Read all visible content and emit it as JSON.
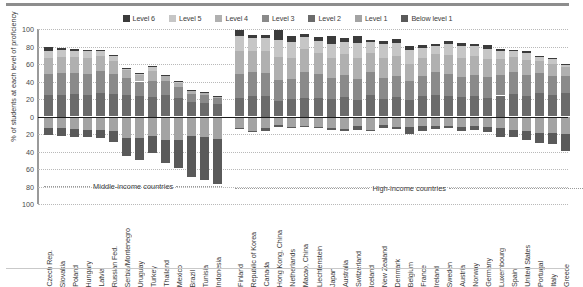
{
  "chart_data": {
    "type": "bar",
    "title": "",
    "subtitle": "",
    "xlabel": "",
    "ylabel": "% of students at each level of proficiency",
    "ylim": [
      -100,
      100
    ],
    "yticks": [
      100,
      80,
      60,
      40,
      20,
      0,
      20,
      40,
      60,
      80,
      100
    ],
    "grid": true,
    "legend_position": "top-center",
    "orientation": "diverging-stacked-vertical",
    "note": "Levels 2-6 plotted above the zero line; Level 1 and Below level 1 plotted below the zero line.",
    "legend": [
      {
        "name": "Level 6",
        "color": "#3b3b3b"
      },
      {
        "name": "Level 5",
        "color": "#c6c6c6"
      },
      {
        "name": "Level 4",
        "color": "#b0b0b0"
      },
      {
        "name": "Level 3",
        "color": "#8a8a8a"
      },
      {
        "name": "Level 2",
        "color": "#6b6b6b"
      },
      {
        "name": "Level 1",
        "color": "#a3a3a3"
      },
      {
        "name": "Below level 1",
        "color": "#5a5a5a"
      }
    ],
    "series": [
      {
        "name": "Level 6",
        "color": "#3b3b3b",
        "side": "up"
      },
      {
        "name": "Level 5",
        "color": "#c6c6c6",
        "side": "up"
      },
      {
        "name": "Level 4",
        "color": "#b0b0b0",
        "side": "up"
      },
      {
        "name": "Level 3",
        "color": "#8a8a8a",
        "side": "up"
      },
      {
        "name": "Level 2",
        "color": "#6b6b6b",
        "side": "up"
      },
      {
        "name": "Level 1",
        "color": "#a3a3a3",
        "side": "down"
      },
      {
        "name": "Below level 1",
        "color": "#5a5a5a",
        "side": "down"
      }
    ],
    "groups": [
      {
        "label": "Middle-income countries",
        "start": 0,
        "end": 13
      },
      {
        "label": "High-income countries",
        "start": 14,
        "end": 40
      }
    ],
    "categories": [
      "Czech Rep.",
      "Slovakia",
      "Poland",
      "Hungary",
      "Latvia",
      "Russian Fed.",
      "Serbia/Montenegro",
      "Uruguay",
      "Turkey",
      "Thailand",
      "Mexico",
      "Brazil",
      "Tunisia",
      "Indonesia",
      "Finland",
      "Republic of Korea",
      "Canada",
      "Hong Kong, China",
      "Netherlands",
      "Macao, China",
      "Liechtenstein",
      "Japan",
      "Australia",
      "Switzerland",
      "Iceland",
      "New Zealand",
      "Denmark",
      "Belgium",
      "France",
      "Ireland",
      "Sweden",
      "Austria",
      "Norway",
      "Germany",
      "Luxembourg",
      "Spain",
      "United States",
      "Portugal",
      "Italy",
      "Greece"
    ],
    "values": {
      "Level 6": [
        3.6,
        2.2,
        2.0,
        1.8,
        1.0,
        1.2,
        0.3,
        0.4,
        1.2,
        0.1,
        0.4,
        0.3,
        0.1,
        0.1,
        6.7,
        3.3,
        4.3,
        10.5,
        7.3,
        3.3,
        4.2,
        8.2,
        4.3,
        7.8,
        3.3,
        4.0,
        4.4,
        5.6,
        3.5,
        2.2,
        3.1,
        3.6,
        3.1,
        4.1,
        2.5,
        1.4,
        2.0,
        1.1,
        1.5,
        0.6
      ],
      "Level 5": [
        8.9,
        7.7,
        7.4,
        7.6,
        5.7,
        5.4,
        2.3,
        2.0,
        4.3,
        1.2,
        1.3,
        1.2,
        0.6,
        0.4,
        16.7,
        14.5,
        15.0,
        20.2,
        18.1,
        14.0,
        13.8,
        16.1,
        14.3,
        17.4,
        11.9,
        16.0,
        15.0,
        15.1,
        11.6,
        9.6,
        12.3,
        13.0,
        11.2,
        12.5,
        9.2,
        6.3,
        8.0,
        4.6,
        5.5,
        3.1
      ],
      "Level 4": [
        18.0,
        18.1,
        17.7,
        18.2,
        16.8,
        15.1,
        9.1,
        7.4,
        11.2,
        5.8,
        4.8,
        3.3,
        2.7,
        1.7,
        26.1,
        25.0,
        25.1,
        26.0,
        23.3,
        26.1,
        24.3,
        22.8,
        23.9,
        24.3,
        21.8,
        23.2,
        23.0,
        20.1,
        20.2,
        20.2,
        22.1,
        21.7,
        21.0,
        20.6,
        18.0,
        17.4,
        17.0,
        14.4,
        14.0,
        10.2
      ],
      "Level 3": [
        24.3,
        24.9,
        24.8,
        24.3,
        25.3,
        22.8,
        19.3,
        17.1,
        19.1,
        15.8,
        13.1,
        9.3,
        8.9,
        6.7,
        27.7,
        26.8,
        26.2,
        24.0,
        23.0,
        29.0,
        26.8,
        24.4,
        25.2,
        23.9,
        26.8,
        24.0,
        24.3,
        21.2,
        23.9,
        26.0,
        25.4,
        23.5,
        24.1,
        23.2,
        23.4,
        25.8,
        23.6,
        23.1,
        22.0,
        19.6
      ],
      "Level 2": [
        24.1,
        25.0,
        25.2,
        24.2,
        26.7,
        25.8,
        24.3,
        22.9,
        22.0,
        24.3,
        20.8,
        16.3,
        15.4,
        14.4,
        21.3,
        23.6,
        23.0,
        17.6,
        20.2,
        21.5,
        21.7,
        20.0,
        21.8,
        18.6,
        24.2,
        19.6,
        22.1,
        19.1,
        22.9,
        24.7,
        23.3,
        22.2,
        23.8,
        21.4,
        24.0,
        25.2,
        23.9,
        26.4,
        24.4,
        26.4
      ],
      "Level 1": [
        12.9,
        13.3,
        14.4,
        15.2,
        15.6,
        17.0,
        24.7,
        25.0,
        22.0,
        26.6,
        26.6,
        21.9,
        23.0,
        26.2,
        12.9,
        16.2,
        13.5,
        10.0,
        11.5,
        11.0,
        12.0,
        13.3,
        14.3,
        11.1,
        15.0,
        10.1,
        11.8,
        11.8,
        11.0,
        11.4,
        10.6,
        11.5,
        11.2,
        12.5,
        13.6,
        15.8,
        16.5,
        18.5,
        18.7,
        20.1
      ],
      "Below level 1": [
        8.2,
        8.8,
        8.5,
        8.7,
        8.9,
        12.7,
        20.0,
        25.2,
        20.2,
        26.2,
        32.0,
        47.7,
        49.3,
        50.5,
        1.5,
        1.5,
        2.5,
        1.7,
        1.5,
        1.2,
        1.3,
        2.4,
        2.8,
        4.5,
        2.0,
        3.1,
        2.4,
        8.0,
        5.5,
        2.7,
        2.5,
        5.6,
        4.0,
        5.7,
        10.3,
        8.0,
        10.0,
        11.9,
        13.0,
        19.8
      ]
    }
  }
}
